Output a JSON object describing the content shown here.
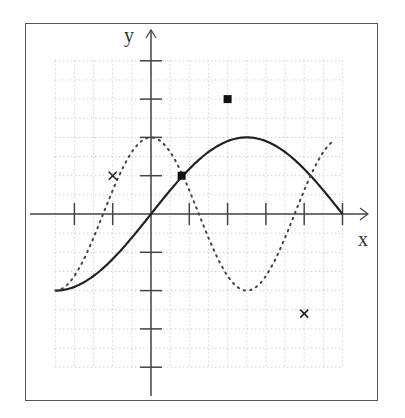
{
  "chart_data": {
    "type": "line",
    "title": "",
    "xlabel": "x",
    "ylabel": "y",
    "xlim": [
      -2.5,
      5
    ],
    "ylim": [
      -4,
      4
    ],
    "grid": true,
    "x_ticks": [
      -2,
      -1,
      0,
      1,
      2,
      3,
      4,
      5
    ],
    "y_ticks": [
      -4,
      -3,
      -2,
      -1,
      1,
      2,
      3,
      4
    ],
    "series": [
      {
        "name": "solid curve",
        "style": "solid",
        "function": "y = 2*sin(pi*x/5)",
        "x": [
          -2.5,
          -2,
          -1,
          0,
          1,
          2,
          2.5,
          3,
          4,
          5
        ],
        "y": [
          -2,
          -1.9,
          -1.18,
          0,
          1.18,
          1.9,
          2,
          1.9,
          1.18,
          0
        ]
      },
      {
        "name": "dotted curve",
        "style": "dotted",
        "function": "y = 2*cos(2*pi*x/5)",
        "x": [
          -2.5,
          -2,
          -1,
          0,
          1.25,
          2.5,
          3.75,
          4.8
        ],
        "y": [
          -2,
          -1.62,
          0.62,
          2,
          0,
          -2,
          0,
          1.95
        ]
      },
      {
        "name": "square markers",
        "style": "marker-square",
        "x": [
          0.8,
          2
        ],
        "y": [
          1,
          3
        ]
      },
      {
        "name": "cross markers",
        "style": "marker-cross",
        "x": [
          -1,
          4
        ],
        "y": [
          1,
          -2.6
        ]
      }
    ]
  },
  "axes": {
    "x_label": "x",
    "y_label": "y"
  }
}
